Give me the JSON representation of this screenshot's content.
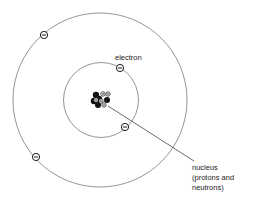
{
  "diagram": {
    "type": "atom-model",
    "labels": {
      "electron": "electron",
      "nucleus_lines": [
        "nucleus",
        "(protons and",
        "neutrons)"
      ]
    },
    "electron_symbol": "minus",
    "proton_symbol": "plus",
    "orbits": [
      {
        "name": "inner-orbit",
        "electrons": 2
      },
      {
        "name": "outer-orbit",
        "electrons": 2
      }
    ],
    "nucleus": {
      "protons": 5,
      "neutrons": 5
    },
    "colors": {
      "orbit": "#7a7a7a",
      "electron_outline": "#1a1a1a",
      "neutron": "#111111",
      "text": "#222222"
    }
  }
}
